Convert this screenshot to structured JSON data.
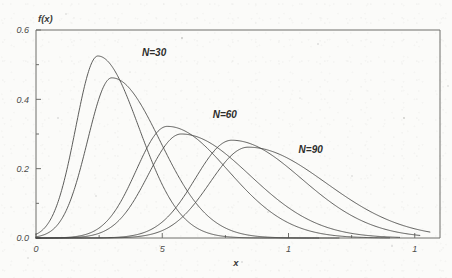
{
  "chart_data": {
    "type": "line",
    "title": "",
    "subtitle": "",
    "xlabel": "x",
    "ylabel": "f(x)",
    "xlim": [
      0,
      1.6
    ],
    "ylim": [
      0,
      0.6
    ],
    "grid": false,
    "legend_position": "inline-annotations",
    "x_ticks": [
      {
        "value": 0,
        "label": "0"
      },
      {
        "value": 0.5,
        "label": "5"
      },
      {
        "value": 1.0,
        "label": "1"
      },
      {
        "value": 1.5,
        "label": "1"
      }
    ],
    "x_minor_ticks": [
      0.25,
      0.75,
      1.25
    ],
    "y_ticks": [
      {
        "value": 0.0,
        "label": "0.0"
      },
      {
        "value": 0.2,
        "label": "0.2"
      },
      {
        "value": 0.4,
        "label": "0.4"
      },
      {
        "value": 0.6,
        "label": "0.6"
      }
    ],
    "y_minor_ticks": [
      0.1,
      0.3,
      0.5
    ],
    "annotations": [
      {
        "text": "N=30",
        "x": 0.42,
        "y": 0.525
      },
      {
        "text": "N=60",
        "x": 0.7,
        "y": 0.345
      },
      {
        "text": "N=90",
        "x": 1.04,
        "y": 0.245
      }
    ],
    "series": [
      {
        "name": "N=30 curve A",
        "group": "N=30",
        "peak_x": 0.245,
        "peak_y": 0.525,
        "spread": 0.105,
        "skew": 0.55,
        "tail_end": 1.12
      },
      {
        "name": "N=30 curve B",
        "group": "N=30",
        "peak_x": 0.3,
        "peak_y": 0.462,
        "spread": 0.118,
        "skew": 0.62,
        "tail_end": 1.2
      },
      {
        "name": "N=60 curve A",
        "group": "N=60",
        "peak_x": 0.52,
        "peak_y": 0.322,
        "spread": 0.15,
        "skew": 0.6,
        "tail_end": 1.4
      },
      {
        "name": "N=60 curve B",
        "group": "N=60",
        "peak_x": 0.575,
        "peak_y": 0.3,
        "spread": 0.163,
        "skew": 0.66,
        "tail_end": 1.44
      },
      {
        "name": "N=90 curve A",
        "group": "N=90",
        "peak_x": 0.775,
        "peak_y": 0.282,
        "spread": 0.175,
        "skew": 0.58,
        "tail_end": 1.52
      },
      {
        "name": "N=90 curve B",
        "group": "N=90",
        "peak_x": 0.84,
        "peak_y": 0.262,
        "spread": 0.188,
        "skew": 0.64,
        "tail_end": 1.56
      }
    ],
    "colors": {
      "curve": "#4a4a47",
      "axis": "#6e6e6a",
      "text": "#3b3b39",
      "background": "#fbfbf9"
    }
  },
  "plot_geometry": {
    "left": 36,
    "right": 440,
    "top": 30,
    "bottom": 238
  }
}
